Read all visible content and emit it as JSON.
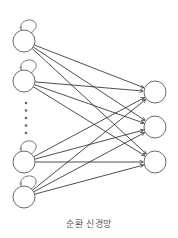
{
  "diagram": {
    "title": "순환 신경망",
    "colors": {
      "node_stroke": "#6a6a6a",
      "edge_stroke": "#222222",
      "background": "#ffffff"
    },
    "input_layer": {
      "nodes": [
        {
          "id": "in1",
          "x": 24,
          "y": 41,
          "self_loop": true
        },
        {
          "id": "in2",
          "x": 24,
          "y": 81,
          "self_loop": true
        },
        {
          "id": "in3",
          "x": 24,
          "y": 162,
          "self_loop": true
        },
        {
          "id": "in4",
          "x": 24,
          "y": 197,
          "self_loop": true
        }
      ],
      "ellipsis": {
        "x": 26,
        "y_start": 103,
        "y_end": 133,
        "count": 5
      }
    },
    "output_layer": {
      "nodes": [
        {
          "id": "out1",
          "x": 155,
          "y": 92
        },
        {
          "id": "out2",
          "x": 155,
          "y": 127
        },
        {
          "id": "out3",
          "x": 155,
          "y": 162
        }
      ]
    },
    "node_radius": 11,
    "connections": "fully-connected input→output with arrowheads"
  }
}
